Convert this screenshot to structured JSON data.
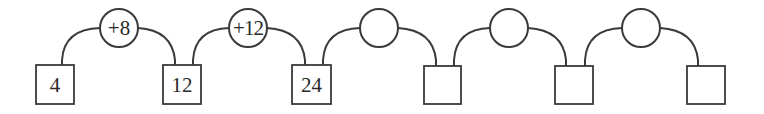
{
  "diagram": {
    "stroke_color": "#3a3a3a",
    "boxes": [
      {
        "value": "4",
        "x": 36,
        "y": 65,
        "w": 38,
        "h": 39
      },
      {
        "value": "12",
        "x": 163,
        "y": 65,
        "w": 38,
        "h": 39
      },
      {
        "value": "24",
        "x": 292,
        "y": 65,
        "w": 39,
        "h": 39
      },
      {
        "value": "",
        "x": 424,
        "y": 66,
        "w": 37,
        "h": 38
      },
      {
        "value": "",
        "x": 555,
        "y": 66,
        "w": 38,
        "h": 38
      },
      {
        "value": "",
        "x": 687,
        "y": 66,
        "w": 38,
        "h": 38
      }
    ],
    "operations": [
      {
        "label": "+8",
        "cx": 119,
        "cy": 28,
        "r": 19
      },
      {
        "label": "+12",
        "cx": 248,
        "cy": 28,
        "r": 19
      },
      {
        "label": "",
        "cx": 379,
        "cy": 28,
        "r": 19
      },
      {
        "label": "",
        "cx": 509,
        "cy": 28,
        "r": 19
      },
      {
        "label": "",
        "cx": 641,
        "cy": 28,
        "r": 19
      }
    ]
  }
}
